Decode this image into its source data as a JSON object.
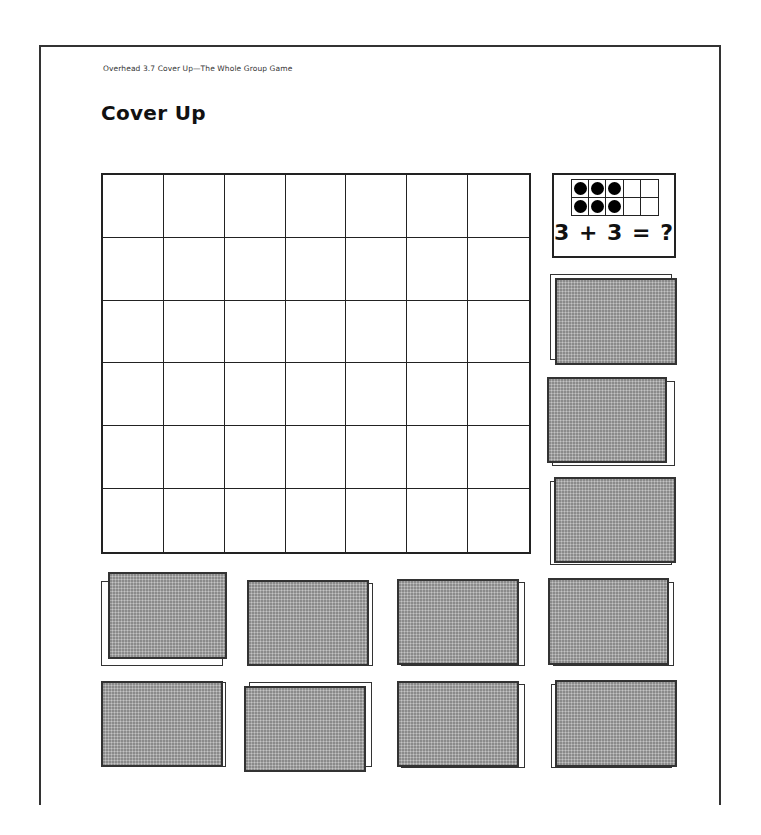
{
  "header": {
    "caption": "Overhead 3.7  Cover Up—The Whole Group Game",
    "title": "Cover Up"
  },
  "game_board": {
    "columns": 7,
    "rows": 6,
    "cells_covered": 0
  },
  "problem_card": {
    "ten_frame": {
      "columns": 5,
      "rows": 2,
      "filled_per_row": 3,
      "dots_total": 6
    },
    "equation": "3 + 3 = ?"
  },
  "card_stacks": {
    "count": 9,
    "fill_color": "#a9a9a9",
    "right_column": [
      {
        "front": [
          555,
          278,
          122,
          87
        ],
        "back": [
          550,
          274,
          122,
          86
        ]
      },
      {
        "front": [
          547,
          377,
          120,
          86
        ],
        "back": [
          552,
          381,
          123,
          85
        ]
      },
      {
        "front": [
          554,
          477,
          122,
          86
        ],
        "back": [
          550,
          481,
          122,
          84
        ]
      },
      {
        "front": [
          548,
          578,
          121,
          87
        ],
        "back": [
          553,
          582,
          121,
          84
        ]
      },
      {
        "front": [
          555,
          680,
          122,
          87
        ],
        "back": [
          551,
          684,
          121,
          84
        ]
      }
    ],
    "bottom_rows": [
      {
        "front": [
          108,
          572,
          119,
          87
        ],
        "back": [
          101,
          581,
          122,
          85
        ]
      },
      {
        "front": [
          247,
          580,
          122,
          86
        ],
        "back": [
          251,
          583,
          122,
          83
        ]
      },
      {
        "front": [
          397,
          579,
          122,
          86
        ],
        "back": [
          401,
          582,
          124,
          84
        ]
      },
      {
        "front": [
          101,
          681,
          122,
          86
        ],
        "back": [
          104,
          682,
          122,
          85
        ]
      },
      {
        "front": [
          244,
          686,
          122,
          86
        ],
        "back": [
          249,
          682,
          123,
          85
        ]
      },
      {
        "front": [
          397,
          681,
          122,
          86
        ],
        "back": [
          401,
          684,
          124,
          84
        ]
      }
    ]
  }
}
